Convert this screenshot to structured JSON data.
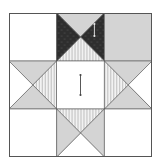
{
  "diagram": {
    "type": "quilt-block",
    "title": "",
    "grid": {
      "rows": 3,
      "cols": 3
    },
    "colors": {
      "background": "#ffffff",
      "outline": "#555555",
      "light_gray": "#d4d4d4",
      "dark": "#2e2e2e",
      "stripe_bg": "#f2f2f2",
      "stripe_line": "#9a9a9a"
    },
    "cells": [
      {
        "row": 0,
        "col": 0,
        "kind": "plain",
        "fill": "white"
      },
      {
        "row": 0,
        "col": 1,
        "kind": "quarter-square",
        "top": "light_gray",
        "right": "dark",
        "bottom": "stripe",
        "left": "dark",
        "arrow": "vertical-small-right"
      },
      {
        "row": 0,
        "col": 2,
        "kind": "plain",
        "fill": "light_gray"
      },
      {
        "row": 1,
        "col": 0,
        "kind": "quarter-square",
        "top": "light_gray",
        "right": "stripe",
        "bottom": "light_gray",
        "left": "white"
      },
      {
        "row": 1,
        "col": 1,
        "kind": "plain",
        "fill": "white",
        "arrow": "vertical-center"
      },
      {
        "row": 1,
        "col": 2,
        "kind": "quarter-square",
        "top": "light_gray",
        "right": "white",
        "bottom": "light_gray",
        "left": "stripe"
      },
      {
        "row": 2,
        "col": 0,
        "kind": "plain",
        "fill": "white"
      },
      {
        "row": 2,
        "col": 1,
        "kind": "quarter-square",
        "top": "stripe",
        "right": "light_gray",
        "bottom": "white",
        "left": "light_gray"
      },
      {
        "row": 2,
        "col": 2,
        "kind": "plain",
        "fill": "white"
      }
    ]
  }
}
